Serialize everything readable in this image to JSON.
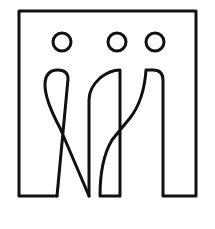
{
  "logo": {
    "description": "Three stylized figures within a square frame",
    "stroke_color": "#111111",
    "background_color": "#ffffff",
    "icons": [
      "frame-outline",
      "head-circle-left",
      "head-circle-middle",
      "head-circle-right",
      "figure-body-left",
      "figure-body-middle",
      "figure-body-right"
    ]
  }
}
